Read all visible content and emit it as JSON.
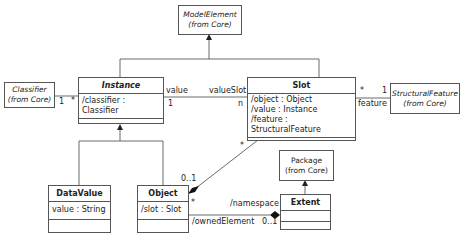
{
  "diagram": {
    "type": "UML class diagram",
    "classes": {
      "model_element": {
        "name": "ModelElement",
        "stereo": "(from Core)"
      },
      "classifier": {
        "name": "Classifier",
        "stereo": "(from Core)"
      },
      "structural_feature": {
        "name": "StructuralFeature",
        "stereo": "(from Core)"
      },
      "package": {
        "name": "Package",
        "stereo": "(from Core)"
      },
      "instance": {
        "name": "Instance",
        "attributes": [
          "/classifier : Classifier"
        ]
      },
      "slot": {
        "name": "Slot",
        "attributes": [
          "/object : Object",
          "/value : Instance",
          "/feature : StructuralFeature"
        ]
      },
      "data_value": {
        "name": "DataValue",
        "attributes": [
          "value : String"
        ]
      },
      "object": {
        "name": "Object",
        "attributes": [
          "/slot : Slot"
        ]
      },
      "extent": {
        "name": "Extent",
        "attributes": []
      }
    },
    "labels": {
      "classifier_mult": "1",
      "instance_classifier_mult": "*",
      "value_role": "value",
      "value_mult": "1",
      "value_slot_role": "valueSlot",
      "value_slot_mult": "n",
      "slot_feature_mult": "*",
      "feature_mult": "1",
      "feature_role": "feature",
      "slot_object_mult": "*",
      "object_slot_mult": "0..1",
      "object_extent_mult": "*",
      "namespace_role": "/namespace",
      "owned_element_role": "/ownedElement",
      "extent_mult": "0..1"
    }
  }
}
